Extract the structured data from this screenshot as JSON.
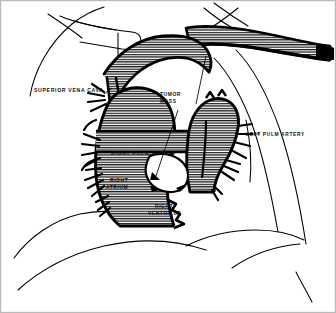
{
  "figure": {
    "type": "anatomical-line-diagram",
    "border_color": "#b9b9b9",
    "background_color": "#ffffff",
    "ink_color": "#000000",
    "hatch_color": "#1a1a1a"
  },
  "labels": {
    "superior_vena_cava": "SUPERIOR VENA CAVA",
    "tumor_mass_line1": "TUMOR",
    "tumor_mass_line2": "MASS",
    "left_pulm_artery": "LEFT PULM ARTERY",
    "right_pulm_artery": "RIGHT PULM ARTERY",
    "right_atrium_line1": "RIGHT",
    "right_atrium_line2": "ATRIUM",
    "right_ventricle_line1": "RIGHT",
    "right_ventricle_line2": "VENTRICLE"
  }
}
